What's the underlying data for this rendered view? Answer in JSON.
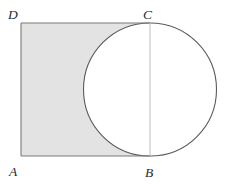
{
  "figure": {
    "type": "geometry-diagram",
    "canvas": {
      "width": 225,
      "height": 184,
      "background": "#ffffff"
    },
    "colors": {
      "shading": "#e3e3e3",
      "square_stroke": "#7a7a7a",
      "circle_stroke": "#5a5a5a",
      "chord_stroke": "#b8b8b8",
      "label_color": "#2b2b2b"
    },
    "square": {
      "name": "ABCD",
      "left": 21,
      "top": 23,
      "right": 150,
      "bottom": 156,
      "side": 133,
      "stroke_width": 1.1
    },
    "circle": {
      "center_x": 150,
      "center_y": 89.5,
      "radius": 66.5,
      "stroke_width": 1.1,
      "fill": "none"
    },
    "chord": {
      "name": "CB",
      "x": 150,
      "y1": 23,
      "y2": 156,
      "stroke_width": 0.9
    },
    "shaded_region": {
      "description": "square ABCD minus the portion overlapped by the circle",
      "fill": "#e3e3e3"
    },
    "labels": [
      {
        "id": "label-A",
        "text": "A",
        "x": 9,
        "y": 176,
        "anchor": "start"
      },
      {
        "id": "label-B",
        "text": "B",
        "x": 145,
        "y": 177,
        "anchor": "start"
      },
      {
        "id": "label-C",
        "text": "C",
        "x": 143,
        "y": 19,
        "anchor": "start"
      },
      {
        "id": "label-D",
        "text": "D",
        "x": 8,
        "y": 19,
        "anchor": "start"
      }
    ]
  }
}
